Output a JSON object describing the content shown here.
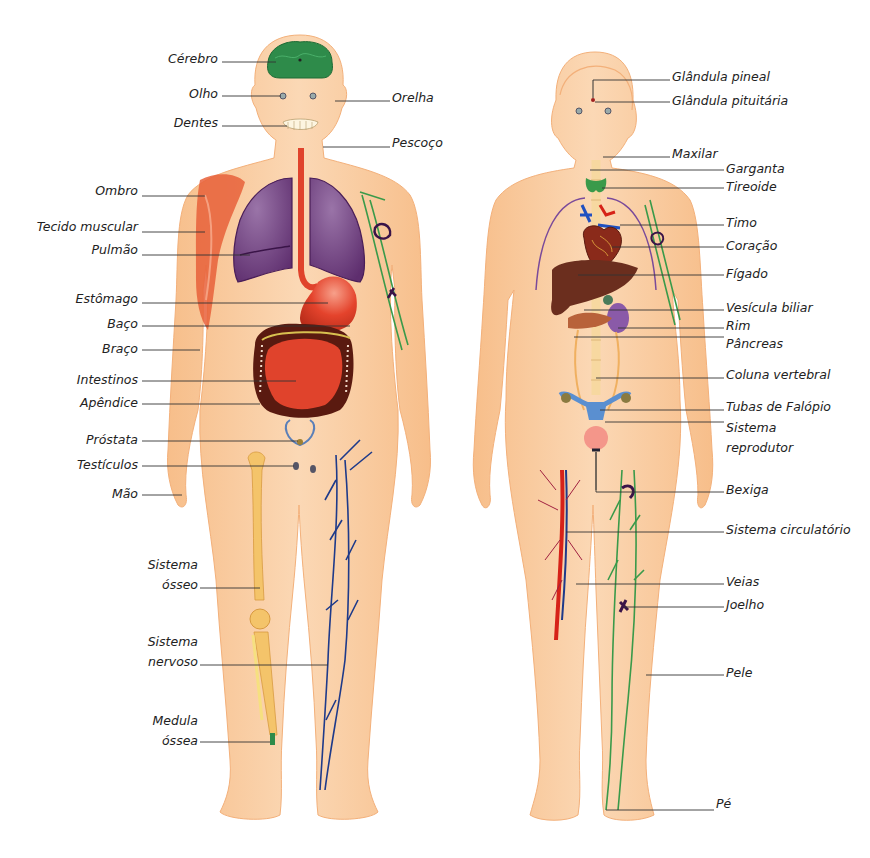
{
  "figure": {
    "language": "pt",
    "colors": {
      "skin": "#f9c99a",
      "skin_light": "#fbdcbd",
      "brain": "#2e8b4a",
      "lung": "#6e3d7a",
      "stomach": "#e0432c",
      "intestine_dark": "#5a1a10",
      "muscle": "#e8603a",
      "bone": "#f4c46a",
      "vein_blue": "#1e3a8a",
      "artery_red": "#d62218",
      "lymph_green": "#3a9a4a",
      "liver": "#6b2e1e",
      "reproductive_blue": "#5a8fd0",
      "label_text": "#222222",
      "leader_line": "#333333"
    }
  },
  "male": {
    "labels_left": [
      {
        "text": "Cérebro",
        "x": 220,
        "y": 58
      },
      {
        "text": "Olho",
        "x": 220,
        "y": 93
      },
      {
        "text": "Dentes",
        "x": 220,
        "y": 122
      },
      {
        "text": "Ombro",
        "x": 140,
        "y": 190
      },
      {
        "text": "Tecido muscular",
        "x": 140,
        "y": 226
      },
      {
        "text": "Pulmão",
        "x": 140,
        "y": 249
      },
      {
        "text": "Estômago",
        "x": 140,
        "y": 300
      },
      {
        "text": "Baço",
        "x": 140,
        "y": 325
      },
      {
        "text": "Braço",
        "x": 140,
        "y": 349
      },
      {
        "text": "Intestinos",
        "x": 140,
        "y": 380
      },
      {
        "text": "Apêndice",
        "x": 140,
        "y": 403
      },
      {
        "text": "Próstata",
        "x": 140,
        "y": 440
      },
      {
        "text": "Testículos",
        "x": 140,
        "y": 465
      },
      {
        "text": "Mão",
        "x": 140,
        "y": 494
      },
      {
        "text": "Sistema",
        "x": 198,
        "y": 565
      },
      {
        "text": "ósseo",
        "x": 198,
        "y": 585
      },
      {
        "text": "Sistema",
        "x": 198,
        "y": 642
      },
      {
        "text": "nervoso",
        "x": 198,
        "y": 662
      },
      {
        "text": "Medula",
        "x": 198,
        "y": 721
      },
      {
        "text": "óssea",
        "x": 198,
        "y": 741
      }
    ],
    "labels_right": [
      {
        "text": "Orelha",
        "x": 392,
        "y": 98
      },
      {
        "text": "Pescoço",
        "x": 392,
        "y": 143
      }
    ]
  },
  "female": {
    "labels_right": [
      {
        "text": "Glândula pineal",
        "x": 672,
        "y": 76
      },
      {
        "text": "Glândula pituitária",
        "x": 672,
        "y": 100
      },
      {
        "text": "Maxilar",
        "x": 672,
        "y": 154
      },
      {
        "text": "Garganta",
        "x": 726,
        "y": 168
      },
      {
        "text": "Tireoide",
        "x": 726,
        "y": 186
      },
      {
        "text": "Timo",
        "x": 726,
        "y": 222
      },
      {
        "text": "Coração",
        "x": 726,
        "y": 245
      },
      {
        "text": "Fígado",
        "x": 726,
        "y": 273
      },
      {
        "text": "Vesícula biliar",
        "x": 726,
        "y": 307
      },
      {
        "text": "Rim",
        "x": 726,
        "y": 325
      },
      {
        "text": "Pâncreas",
        "x": 726,
        "y": 343
      },
      {
        "text": "Coluna vertebral",
        "x": 726,
        "y": 374
      },
      {
        "text": "Tubas de Falópio",
        "x": 726,
        "y": 406
      },
      {
        "text": "Sistema",
        "x": 726,
        "y": 428
      },
      {
        "text": "reprodutor",
        "x": 726,
        "y": 448
      },
      {
        "text": "Bexiga",
        "x": 726,
        "y": 489
      },
      {
        "text": "Sistema circulatório",
        "x": 726,
        "y": 529
      },
      {
        "text": "Veias",
        "x": 726,
        "y": 581
      },
      {
        "text": "Joelho",
        "x": 726,
        "y": 604
      },
      {
        "text": "Pele",
        "x": 726,
        "y": 672
      },
      {
        "text": "Pé",
        "x": 716,
        "y": 803
      }
    ]
  }
}
